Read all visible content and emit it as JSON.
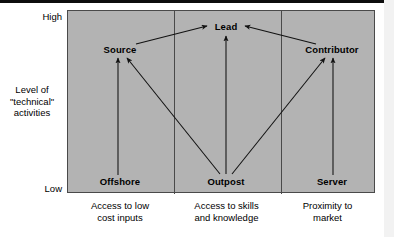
{
  "diagram": {
    "axis": {
      "high_label": "High",
      "low_label": "Low",
      "vertical_title": "Level of\n\"technical\"\nactivities"
    },
    "columns": [
      {
        "bottom_node": "Offshore",
        "top_node": "Source",
        "caption": "Access to low\ncost inputs"
      },
      {
        "bottom_node": "Outpost",
        "top_node": "Lead",
        "caption": "Access to skills\nand knowledge"
      },
      {
        "bottom_node": "Server",
        "top_node": "Contributor",
        "caption": "Proximity to\nmarket"
      }
    ],
    "nodes": {
      "source": "Source",
      "lead": "Lead",
      "contributor": "Contributor",
      "offshore": "Offshore",
      "outpost": "Outpost",
      "server": "Server"
    },
    "arrows": [
      {
        "from": "Offshore",
        "to": "Source"
      },
      {
        "from": "Outpost",
        "to": "Source"
      },
      {
        "from": "Outpost",
        "to": "Lead"
      },
      {
        "from": "Outpost",
        "to": "Contributor"
      },
      {
        "from": "Server",
        "to": "Contributor"
      },
      {
        "from": "Source",
        "to": "Lead"
      },
      {
        "from": "Contributor",
        "to": "Lead"
      }
    ],
    "colors": {
      "plot_background": "#b3b3b3",
      "border": "#4a4a4a",
      "text": "#000000",
      "page_background": "#ffffff"
    }
  }
}
